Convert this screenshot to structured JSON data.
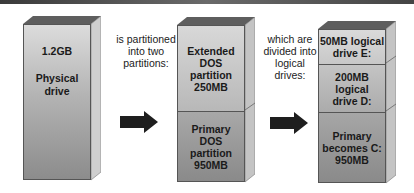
{
  "diagram": {
    "title_rule": true,
    "physical_drive": {
      "size": "1.2GB",
      "label_line1": "Physical",
      "label_line2": "drive"
    },
    "caption_1": {
      "line1": "is partitioned",
      "line2": "into two",
      "line3": "partitions:"
    },
    "partitions": [
      {
        "line1": "Extended",
        "line2": "DOS",
        "line3": "partition",
        "line4": "250MB"
      },
      {
        "line1": "Primary",
        "line2": "DOS",
        "line3": "partition",
        "line4": "950MB"
      }
    ],
    "caption_2": {
      "line1": "which are",
      "line2": "divided into",
      "line3": "logical",
      "line4": "drives:"
    },
    "logical_drives": [
      {
        "line1": "50MB logical",
        "line2": "drive E:"
      },
      {
        "line1": "200MB",
        "line2": "logical",
        "line3": "drive D:"
      },
      {
        "line1": "Primary",
        "line2": "becomes C:",
        "line3": "950MB"
      }
    ],
    "arrows": [
      "right-arrow",
      "right-arrow"
    ],
    "colors": {
      "top_face": "#5e5e5e",
      "side_face": "#c8c8c8",
      "front_light": "#d6d6d6",
      "front_dark": "#8a8a8a",
      "arrow": "#1e1e1e"
    }
  }
}
